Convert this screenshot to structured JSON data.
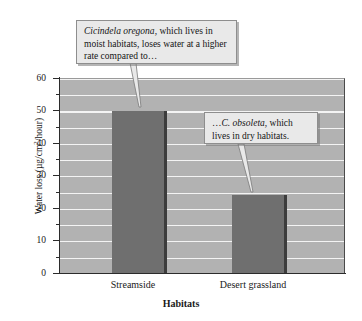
{
  "chart_data": {
    "type": "bar",
    "title": "",
    "categories": [
      "Streamside",
      "Desert grassland"
    ],
    "values": [
      50,
      24
    ],
    "xlabel": "Habitats",
    "ylabel": "Water loss (µg/cm²/hour)",
    "ylim": [
      0,
      60
    ],
    "ytick_major": [
      0,
      10,
      20,
      30,
      40,
      50,
      60
    ],
    "ytick_minor": [
      5,
      15,
      25,
      35,
      45,
      55
    ],
    "grid": true,
    "grid_interval": 5,
    "legend": null,
    "series": [
      {
        "name": "Water loss",
        "values": [
          50,
          24
        ],
        "color": "#6f6f6f"
      }
    ],
    "annotations": [
      {
        "id": "callout-1",
        "text_parts": {
          "italic": "Cicindela oregona",
          "rest": ", which lives in moist habitats, loses water at a higher rate compared to…"
        },
        "points_to_category": "Streamside"
      },
      {
        "id": "callout-2",
        "text_parts": {
          "lead": "…",
          "italic": "C. obsoleta",
          "rest": ", which lives in dry habitats."
        },
        "points_to_category": "Desert grassland"
      }
    ]
  },
  "axis": {
    "y_title_main": "Water loss (µg/cm",
    "y_title_sup": "2",
    "y_title_tail": "/hour)",
    "y_labels": {
      "t60": "60",
      "t50": "50",
      "t40": "40",
      "t30": "30",
      "t20": "20",
      "t10": "10",
      "t0": "0"
    },
    "x_labels": {
      "c0": "Streamside",
      "c1": "Desert grassland"
    },
    "x_title": "Habitats"
  },
  "callouts": {
    "one": {
      "italic": "Cicindela oregona",
      "rest": ", which lives in moist habitats, loses water at a higher rate compared to…"
    },
    "two": {
      "lead": "…",
      "italic": "C. obsoleta",
      "rest": ", which lives in dry habitats."
    }
  },
  "colors": {
    "plot_background": "#b2b2b2",
    "bar_fill": "#6f6f6f",
    "bar_edge": "#3c3c3c",
    "gridline": "#ffffff",
    "callout_fill": "#e9e9e9",
    "callout_border": "#8e8e8e",
    "axis": "#2b2b2b",
    "page_background": "#ffffff"
  }
}
